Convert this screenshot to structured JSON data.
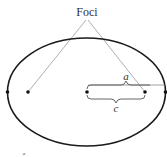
{
  "diagram": {
    "title_label": "Foci",
    "semi_major_label": "a",
    "focal_distance_label": "c",
    "corner_mark": "a",
    "colors": {
      "ellipse": "#1a1a1a",
      "leader": "#9a9a9a",
      "brace": "#555555",
      "point": "#111111"
    },
    "points": [
      "left-vertex",
      "left-focus",
      "center",
      "right-focus",
      "right-vertex"
    ]
  }
}
